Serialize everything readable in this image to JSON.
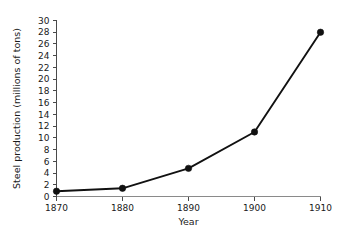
{
  "chart_data": {
    "type": "line",
    "title": "",
    "subtitle": "",
    "xlabel": "Year",
    "ylabel": "Steel production (millions of tons)",
    "x": [
      1870,
      1880,
      1890,
      1900,
      1910
    ],
    "values": [
      0.9,
      1.4,
      4.8,
      11.0,
      28.0
    ],
    "xtick_labels": [
      "1870",
      "1880",
      "1890",
      "1900",
      "1910"
    ],
    "ytick_labels": [
      "0",
      "2",
      "4",
      "6",
      "8",
      "10",
      "12",
      "14",
      "16",
      "18",
      "20",
      "22",
      "24",
      "26",
      "28",
      "30"
    ],
    "ytick_values": [
      0,
      2,
      4,
      6,
      8,
      10,
      12,
      14,
      16,
      18,
      20,
      22,
      24,
      26,
      28,
      30
    ],
    "xlim": [
      1870,
      1910
    ],
    "ylim": [
      0,
      30
    ],
    "grid": false,
    "legend": false,
    "legend_position": "none",
    "marker": "filled-circle",
    "series": [
      {
        "name": "Steel production",
        "values": [
          0.9,
          1.4,
          4.8,
          11.0,
          28.0
        ]
      }
    ],
    "colors": {
      "line": "#111111",
      "marker": "#111111",
      "axis": "#4a4a4a",
      "x_axis": "#8a8a8a",
      "background": "#ffffff",
      "text": "#1a1a1a"
    }
  },
  "axes": {
    "y_title": "Steel production (millions of tons)",
    "x_title": "Year"
  }
}
